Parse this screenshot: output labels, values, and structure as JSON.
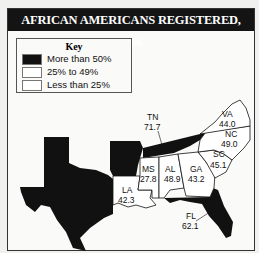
{
  "title": "AFRICAN AMERICANS REGISTERED, 1966",
  "key": {
    "title": "Key",
    "items": [
      {
        "label": "More than 50%",
        "color": "#111111"
      },
      {
        "label": "25% to 49%",
        "color": "#ffffff"
      },
      {
        "label": "Less than 25%",
        "color": "#ffffff"
      }
    ]
  },
  "states": [
    {
      "abbr": "TN",
      "value": "71.7",
      "category": "More than 50%"
    },
    {
      "abbr": "VA",
      "value": "44.0",
      "category": "25% to 49%"
    },
    {
      "abbr": "NC",
      "value": "49.0",
      "category": "25% to 49%"
    },
    {
      "abbr": "SC",
      "value": "45.1",
      "category": "25% to 49%"
    },
    {
      "abbr": "GA",
      "value": "43.2",
      "category": "25% to 49%"
    },
    {
      "abbr": "AL",
      "value": "48.9",
      "category": "25% to 49%"
    },
    {
      "abbr": "MS",
      "value": "27.8",
      "category": "25% to 49%"
    },
    {
      "abbr": "LA",
      "value": "42.3",
      "category": "25% to 49%"
    },
    {
      "abbr": "FL",
      "value": "62.1",
      "category": "More than 50%"
    },
    {
      "abbr": "TX",
      "value": "",
      "category": "More than 50%"
    },
    {
      "abbr": "AR",
      "value": "",
      "category": "More than 50%"
    }
  ]
}
